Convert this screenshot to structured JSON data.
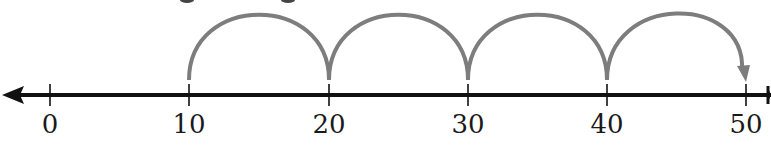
{
  "diagram": {
    "type": "number-line-skip-counting",
    "axis": {
      "min_visible": 0,
      "max_visible": 50,
      "tick_step": 10,
      "arrow_left": true,
      "arrow_right": true,
      "color": "#111111"
    },
    "ticks": [
      {
        "value": 0,
        "label": "0",
        "x": 50
      },
      {
        "value": 10,
        "label": "10",
        "x": 189
      },
      {
        "value": 20,
        "label": "20",
        "x": 329
      },
      {
        "value": 30,
        "label": "30",
        "x": 468
      },
      {
        "value": 40,
        "label": "40",
        "x": 607
      },
      {
        "value": 50,
        "label": "50",
        "x": 746
      }
    ],
    "jumps": [
      {
        "from": 10,
        "to": 20,
        "arrowhead": false
      },
      {
        "from": 20,
        "to": 30,
        "arrowhead": false
      },
      {
        "from": 30,
        "to": 40,
        "arrowhead": false
      },
      {
        "from": 40,
        "to": 50,
        "arrowhead": true
      }
    ],
    "jump_color": "#7d7d7d",
    "jump_size": 10,
    "start": 10,
    "end": 50
  }
}
